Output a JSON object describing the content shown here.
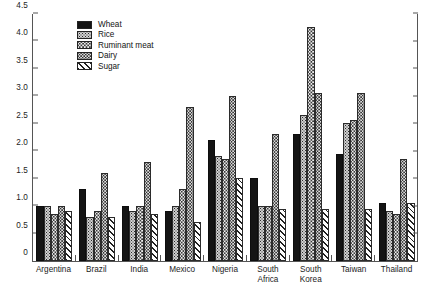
{
  "chart_data": {
    "type": "bar",
    "title": "",
    "subtitle": "",
    "xlabel": "",
    "ylabel": "",
    "ylim": [
      0,
      4.5
    ],
    "ytick_values": [
      0,
      0.5,
      1.0,
      1.5,
      2.0,
      2.5,
      3.0,
      3.5,
      4.0,
      4.5
    ],
    "ytick_labels": [
      "0",
      "0.5",
      "1.0",
      "1.5",
      "2.0",
      "2.5",
      "3.0",
      "3.5",
      "4.0",
      "4.5"
    ],
    "grid": false,
    "legend_position": "top-left",
    "categories": [
      "Argentina",
      "Brazil",
      "India",
      "Mexico",
      "Nigeria",
      "South\nAfrica",
      "South\nKorea",
      "Taiwan",
      "Thailand"
    ],
    "series": [
      {
        "name": "Wheat",
        "pattern": "solid-black",
        "color": "#141414",
        "values": [
          1.0,
          1.3,
          1.0,
          0.9,
          2.2,
          1.5,
          2.3,
          1.95,
          1.05
        ]
      },
      {
        "name": "Rice",
        "pattern": "dense-dots",
        "color": "#cfcfcf",
        "values": [
          1.0,
          0.8,
          0.9,
          1.0,
          1.9,
          1.0,
          2.65,
          2.5,
          0.9
        ]
      },
      {
        "name": "Ruminant meat",
        "pattern": "light-dots",
        "color": "#efefef",
        "values": [
          0.85,
          0.9,
          1.0,
          1.3,
          1.85,
          1.0,
          4.25,
          2.55,
          0.85
        ]
      },
      {
        "name": "Dairy",
        "pattern": "medium-dots",
        "color": "#e2e2e2",
        "values": [
          1.0,
          1.6,
          1.8,
          2.8,
          3.0,
          2.3,
          3.05,
          3.05,
          1.85
        ]
      },
      {
        "name": "Sugar",
        "pattern": "diagonal-hatch",
        "color": "#ffffff",
        "values": [
          0.9,
          0.8,
          0.85,
          0.7,
          1.5,
          0.95,
          0.95,
          0.95,
          1.05
        ]
      }
    ]
  },
  "caption": {
    "text": ""
  }
}
